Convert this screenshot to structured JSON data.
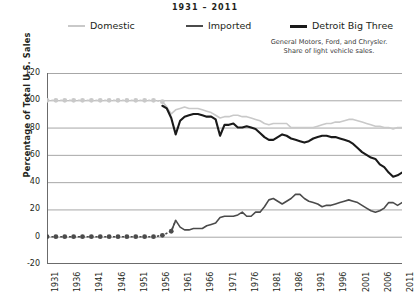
{
  "chart_data": {
    "type": "line",
    "title": "1931 – 2011",
    "subtitle_lines": [
      "General Motors, Ford, and Chrysler.",
      "Share of light vehicle sales."
    ],
    "xlabel": "",
    "ylabel": "Percentage of Total U.S. Sales",
    "xlim": [
      1931,
      2011
    ],
    "ylim": [
      -20,
      120
    ],
    "y_ticks": [
      120,
      100,
      80,
      60,
      40,
      20,
      0,
      -20
    ],
    "x_ticks": [
      1931,
      1936,
      1941,
      1946,
      1951,
      1956,
      1961,
      1966,
      1971,
      1976,
      1981,
      1986,
      1991,
      1996,
      2001,
      2006,
      2011
    ],
    "grid": "horizontal",
    "legend_position": "top",
    "series": [
      {
        "name": "Domestic",
        "color": "#c9c9c9",
        "width": 1.6,
        "marker": "dot",
        "marker_years_every": 2,
        "marker_until": 1957,
        "x": [
          1931,
          1933,
          1935,
          1937,
          1939,
          1941,
          1943,
          1945,
          1947,
          1949,
          1951,
          1953,
          1955,
          1957,
          1958,
          1959,
          1960,
          1961,
          1962,
          1963,
          1964,
          1965,
          1966,
          1967,
          1968,
          1969,
          1970,
          1971,
          1972,
          1973,
          1974,
          1975,
          1976,
          1977,
          1978,
          1979,
          1980,
          1981,
          1982,
          1983,
          1984,
          1985,
          1986,
          1987,
          1988,
          1989,
          1990,
          1991,
          1992,
          1993,
          1994,
          1995,
          1996,
          1997,
          1998,
          1999,
          2000,
          2001,
          2002,
          2003,
          2004,
          2005,
          2006,
          2007,
          2008,
          2009,
          2010,
          2011
        ],
        "y": [
          100,
          100,
          100,
          100,
          100,
          100,
          100,
          100,
          100,
          100,
          100,
          100,
          100,
          99,
          95,
          90,
          93,
          94,
          95,
          94,
          94,
          94,
          93,
          92,
          91,
          89,
          87,
          88,
          88,
          89,
          89,
          88,
          88,
          87,
          86,
          85,
          83,
          82,
          83,
          83,
          83,
          83,
          80,
          80,
          80,
          80,
          80,
          80,
          81,
          82,
          83,
          83,
          84,
          84,
          85,
          86,
          86,
          85,
          84,
          83,
          82,
          81,
          81,
          80,
          80,
          79,
          80,
          80
        ]
      },
      {
        "name": "Detroit Big Three",
        "color": "#1a1a1a",
        "width": 2.1,
        "marker": "none",
        "x": [
          1957,
          1958,
          1959,
          1960,
          1961,
          1962,
          1963,
          1964,
          1965,
          1966,
          1967,
          1968,
          1969,
          1970,
          1971,
          1972,
          1973,
          1974,
          1975,
          1976,
          1977,
          1978,
          1979,
          1980,
          1981,
          1982,
          1983,
          1984,
          1985,
          1986,
          1987,
          1988,
          1989,
          1990,
          1991,
          1992,
          1993,
          1994,
          1995,
          1996,
          1997,
          1998,
          1999,
          2000,
          2001,
          2002,
          2003,
          2004,
          2005,
          2006,
          2007,
          2008,
          2009,
          2010,
          2011
        ],
        "y": [
          96,
          94,
          87,
          75,
          85,
          88,
          89,
          90,
          90,
          89,
          88,
          88,
          86,
          74,
          82,
          82,
          83,
          80,
          80,
          81,
          80,
          79,
          76,
          73,
          71,
          71,
          73,
          75,
          74,
          72,
          71,
          70,
          69,
          70,
          72,
          73,
          74,
          74,
          73,
          73,
          72,
          71,
          70,
          68,
          65,
          62,
          60,
          58,
          57,
          53,
          51,
          47,
          44,
          45,
          47
        ]
      },
      {
        "name": "Imported",
        "color": "#4b4b4b",
        "width": 1.6,
        "marker": "dot",
        "marker_years_every": 2,
        "marker_until": 1959,
        "x": [
          1931,
          1933,
          1935,
          1937,
          1939,
          1941,
          1943,
          1945,
          1947,
          1949,
          1951,
          1953,
          1955,
          1957,
          1959,
          1960,
          1961,
          1962,
          1963,
          1964,
          1965,
          1966,
          1967,
          1968,
          1969,
          1970,
          1971,
          1972,
          1973,
          1974,
          1975,
          1976,
          1977,
          1978,
          1979,
          1980,
          1981,
          1982,
          1983,
          1984,
          1985,
          1986,
          1987,
          1988,
          1989,
          1990,
          1991,
          1992,
          1993,
          1994,
          1995,
          1996,
          1997,
          1998,
          1999,
          2000,
          2001,
          2002,
          2003,
          2004,
          2005,
          2006,
          2007,
          2008,
          2009,
          2010,
          2011
        ],
        "y": [
          0,
          0,
          0,
          0,
          0,
          0,
          0,
          0,
          0,
          0,
          0,
          0,
          0,
          1,
          4,
          12,
          7,
          5,
          5,
          6,
          6,
          6,
          8,
          9,
          10,
          14,
          15,
          15,
          15,
          16,
          18,
          15,
          15,
          18,
          18,
          22,
          27,
          28,
          26,
          24,
          26,
          28,
          31,
          31,
          28,
          26,
          25,
          24,
          22,
          23,
          23,
          24,
          25,
          26,
          27,
          26,
          25,
          23,
          21,
          19,
          18,
          19,
          21,
          25,
          25,
          23,
          25
        ]
      }
    ]
  },
  "axis": {
    "y_title": "Percentage of Total U.S. Sales"
  }
}
